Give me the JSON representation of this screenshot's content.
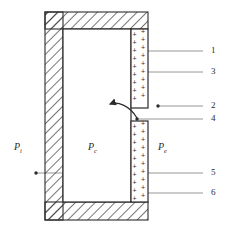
{
  "figure": {
    "background_color": "#ffffff",
    "line_color": "#2b2b2b",
    "hatch_color": "#3a3a3a",
    "leader_color": "#8a8a8a",
    "charge_symbol": "+"
  },
  "pressure_labels": [
    {
      "id": "p-i",
      "symbol": "P",
      "subscript": "i",
      "x": 14,
      "y": 142
    },
    {
      "id": "p-c",
      "symbol": "P",
      "subscript": "c",
      "x": 88,
      "y": 142
    },
    {
      "id": "p-e",
      "symbol": "P",
      "subscript": "e",
      "x": 158,
      "y": 142
    }
  ],
  "callouts": [
    {
      "id": "callout-1",
      "label": "1",
      "x": 211,
      "y": 48
    },
    {
      "id": "callout-3",
      "label": "3",
      "x": 211,
      "y": 69
    },
    {
      "id": "callout-2",
      "label": "2",
      "x": 211,
      "y": 103
    },
    {
      "id": "callout-4",
      "label": "4",
      "x": 211,
      "y": 116
    },
    {
      "id": "callout-5",
      "label": "5",
      "x": 211,
      "y": 170
    },
    {
      "id": "callout-6",
      "label": "6",
      "x": 211,
      "y": 190
    }
  ],
  "charges": {
    "upper_column_count": 9,
    "lower_column_count": 10,
    "columns_per_segment": 2
  }
}
